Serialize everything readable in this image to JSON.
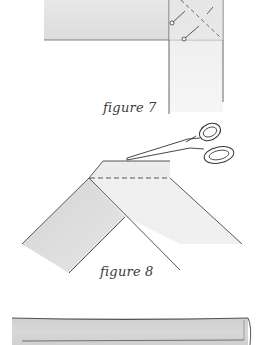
{
  "figures": [
    {
      "id": "figure-7",
      "caption": "figure 7",
      "description": "Two fabric strips joined at a right angle, pinned with a diagonal dashed stitch line"
    },
    {
      "id": "figure-8",
      "caption": "figure 8",
      "description": "Strips folded into an inverted V with scissors trimming along dashed line"
    },
    {
      "id": "figure-9-partial",
      "caption": "",
      "description": "Long folded fabric strip (partially visible)"
    }
  ],
  "colors": {
    "fabric_light": "#ebebeb",
    "fabric_mid": "#d9d9d9",
    "fabric_dark": "#cfcfcf",
    "outline": "#555555",
    "background": "#ffffff"
  }
}
